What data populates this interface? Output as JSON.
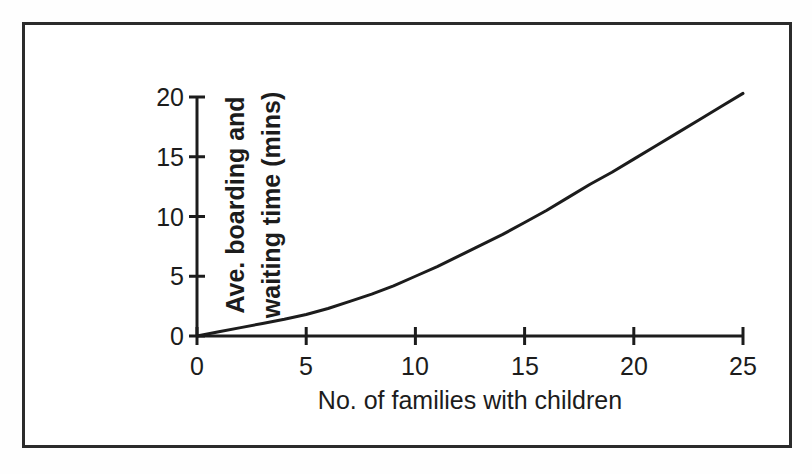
{
  "chart_data": {
    "type": "line",
    "title": "",
    "xlabel": "No. of families with children",
    "ylabel": "Ave. boarding and waiting time (mins)",
    "ylabel_lines": [
      "Ave. boarding and",
      "waiting time (mins)"
    ],
    "xlim": [
      0,
      25
    ],
    "ylim": [
      0,
      20
    ],
    "xticks": [
      0,
      5,
      10,
      15,
      20,
      25
    ],
    "yticks": [
      0,
      5,
      10,
      15,
      20
    ],
    "xticklabels": [
      "0",
      "5",
      "10",
      "15",
      "20",
      "25"
    ],
    "yticklabels": [
      "0",
      "5",
      "10",
      "15",
      "20"
    ],
    "grid": false,
    "legend": false,
    "series": [
      {
        "name": "Ave. boarding and waiting time",
        "color": "#1c1c1c",
        "x": [
          0,
          1,
          2,
          3,
          4,
          5,
          6,
          7,
          8,
          9,
          10,
          11,
          12,
          13,
          14,
          15,
          16,
          17,
          18,
          19,
          20,
          21,
          22,
          23,
          24,
          25
        ],
        "y": [
          0.0,
          0.35,
          0.7,
          1.05,
          1.4,
          1.8,
          2.3,
          2.9,
          3.5,
          4.2,
          5.0,
          5.8,
          6.7,
          7.6,
          8.5,
          9.5,
          10.5,
          11.6,
          12.7,
          13.7,
          14.8,
          15.9,
          17.0,
          18.1,
          19.2,
          20.3
        ]
      }
    ]
  },
  "axes": {
    "y_tick_labels": [
      "20",
      "15",
      "10",
      "5",
      "0"
    ],
    "x_tick_labels": [
      "0",
      "5",
      "10",
      "15",
      "20",
      "25"
    ],
    "x_title": "No. of families with children",
    "y_title_line_1": "Ave. boarding and",
    "y_title_line_2": "waiting time (mins)"
  },
  "colors": {
    "line": "#1c1c1c",
    "axis": "#1c1c1c",
    "frame": "#2b2b2b",
    "background": "#ffffff"
  }
}
